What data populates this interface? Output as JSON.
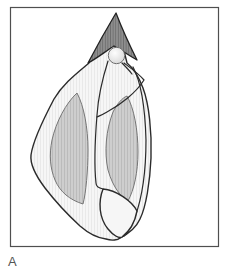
{
  "figure": {
    "label": "A"
  },
  "colors": {
    "background": "#ffffff",
    "frame_border": "#4f4f4f",
    "outline": "#2b2b2b",
    "body_fill": "#f6f6f6",
    "body_hatch": "#e9e9e9",
    "band_fill": "#cecece",
    "band_hatch": "#bbbbbb",
    "band_outline": "#767676",
    "spire_fill": "#8e8e8e",
    "spire_hatch": "#6e6e6e",
    "spire_outline": "#222222",
    "knob_light": "#fdfdfd",
    "knob_dark": "#d4d4d4",
    "knob_stroke": "#6f6f6f",
    "label_color": "#545454"
  }
}
